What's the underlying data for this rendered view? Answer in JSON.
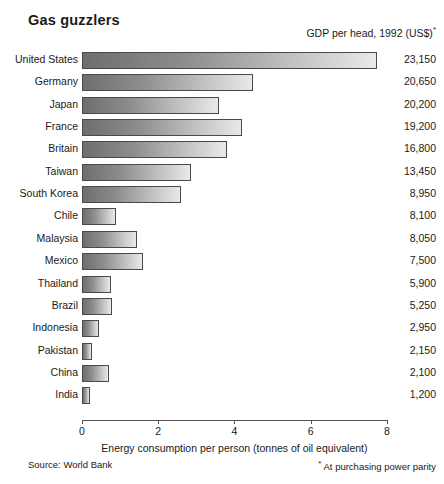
{
  "title": "Gas guzzlers",
  "value_header": "GDP per head, 1992 (US$)",
  "value_header_marker": "*",
  "footer": {
    "source": "Source: World Bank",
    "note_marker": "*",
    "note": " At purchasing power parity"
  },
  "chart_data": {
    "type": "bar",
    "orientation": "horizontal",
    "title": "Gas guzzlers",
    "xlabel": "Energy consumption per person (tonnes of oil equivalent)",
    "ylabel": "",
    "xlim": [
      0,
      8
    ],
    "xticks": [
      0,
      2,
      4,
      6,
      8
    ],
    "xtick_labels": [
      "0",
      "2",
      "4",
      "6",
      "8"
    ],
    "grid": false,
    "legend": null,
    "categories": [
      "United States",
      "Germany",
      "Japan",
      "France",
      "Britain",
      "Taiwan",
      "South Korea",
      "Chile",
      "Malaysia",
      "Mexico",
      "Thailand",
      "Brazil",
      "Indonesia",
      "Pakistan",
      "China",
      "India"
    ],
    "values": [
      7.75,
      4.5,
      3.6,
      4.2,
      3.8,
      2.85,
      2.6,
      0.9,
      1.45,
      1.6,
      0.75,
      0.8,
      0.45,
      0.25,
      0.7,
      0.22
    ],
    "secondary_series": {
      "name": "GDP per head, 1992 (US$)",
      "labels": [
        "23,150",
        "20,650",
        "20,200",
        "19,200",
        "16,800",
        "13,450",
        "8,950",
        "8,100",
        "8,050",
        "7,500",
        "5,900",
        "5,250",
        "2,950",
        "2,150",
        "2,100",
        "1,200"
      ],
      "values": [
        23150,
        20650,
        20200,
        19200,
        16800,
        13450,
        8950,
        8100,
        8050,
        7500,
        5900,
        5250,
        2950,
        2150,
        2100,
        1200
      ]
    },
    "colors": {
      "bar_gradient_start": "#6e6e6e",
      "bar_gradient_end": "#e9e9e9",
      "bar_border": "#4a4a4a",
      "axis": "#555555",
      "text": "#1a1a1a",
      "background": "#ffffff"
    }
  }
}
